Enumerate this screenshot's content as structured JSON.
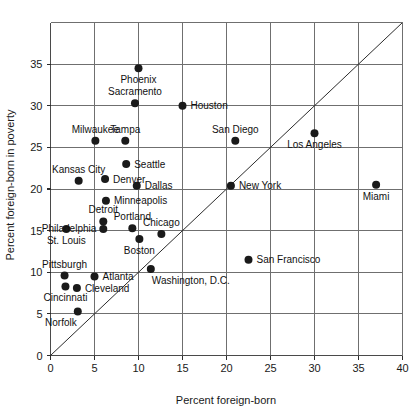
{
  "chart_data": {
    "type": "scatter",
    "title": "",
    "xlabel": "Percent foreign-born",
    "ylabel": "Percent foreign-born in poverty",
    "xlim": [
      0,
      40
    ],
    "ylim": [
      0,
      40
    ],
    "xticks": [
      0,
      5,
      10,
      15,
      20,
      25,
      30,
      35,
      40
    ],
    "yticks": [
      0,
      5,
      10,
      15,
      20,
      25,
      30,
      35
    ],
    "ytick_labels": [
      "0",
      "5",
      "10",
      "15",
      "20",
      "25",
      "30",
      "35"
    ],
    "xtick_labels": [
      "0",
      "5",
      "10",
      "15",
      "20",
      "25",
      "30",
      "35",
      "40"
    ],
    "grid": true,
    "legend": "none",
    "reference_line": {
      "name": "identity-line",
      "from": [
        0,
        0
      ],
      "to": [
        40,
        40
      ],
      "description": "y = x diagonal"
    },
    "points": [
      {
        "label": "Phoenix",
        "x": 10.0,
        "y": 34.5,
        "label_pos": "below"
      },
      {
        "label": "Sacramento",
        "x": 9.6,
        "y": 30.3,
        "label_pos": "above"
      },
      {
        "label": "Houston",
        "x": 15.0,
        "y": 30.0,
        "label_pos": "right"
      },
      {
        "label": "Los Angeles",
        "x": 30.0,
        "y": 26.7,
        "label_pos": "below"
      },
      {
        "label": "Milwaukee",
        "x": 5.1,
        "y": 25.8,
        "label_pos": "above"
      },
      {
        "label": "Tampa",
        "x": 8.5,
        "y": 25.8,
        "label_pos": "above"
      },
      {
        "label": "San Diego",
        "x": 21.0,
        "y": 25.8,
        "label_pos": "above"
      },
      {
        "label": "Seattle",
        "x": 8.6,
        "y": 23.0,
        "label_pos": "right"
      },
      {
        "label": "Denver",
        "x": 6.2,
        "y": 21.2,
        "label_pos": "right"
      },
      {
        "label": "Kansas City",
        "x": 3.2,
        "y": 21.0,
        "label_pos": "above"
      },
      {
        "label": "Miami",
        "x": 37.0,
        "y": 20.5,
        "label_pos": "below"
      },
      {
        "label": "New York",
        "x": 20.5,
        "y": 20.4,
        "label_pos": "right"
      },
      {
        "label": "Dallas",
        "x": 9.8,
        "y": 20.4,
        "label_pos": "right"
      },
      {
        "label": "Minneapolis",
        "x": 6.3,
        "y": 18.6,
        "label_pos": "right"
      },
      {
        "label": "Detroit",
        "x": 6.0,
        "y": 16.1,
        "label_pos": "above"
      },
      {
        "label": "Portland",
        "x": 9.3,
        "y": 15.3,
        "label_pos": "above"
      },
      {
        "label": "St. Louis",
        "x": 1.8,
        "y": 15.2,
        "label_pos": "below"
      },
      {
        "label": "Philadelphia",
        "x": 6.0,
        "y": 15.2,
        "label_pos": "left-below"
      },
      {
        "label": "Chicago",
        "x": 12.6,
        "y": 14.6,
        "label_pos": "above"
      },
      {
        "label": "Boston",
        "x": 10.1,
        "y": 14.0,
        "label_pos": "below"
      },
      {
        "label": "Washington, D.C.",
        "x": 11.4,
        "y": 10.4,
        "label_pos": "below-right"
      },
      {
        "label": "Pittsburgh",
        "x": 1.6,
        "y": 9.6,
        "label_pos": "above"
      },
      {
        "label": "Atlanta",
        "x": 5.0,
        "y": 9.5,
        "label_pos": "right"
      },
      {
        "label": "Cincinnati",
        "x": 1.7,
        "y": 8.3,
        "label_pos": "below"
      },
      {
        "label": "Cleveland",
        "x": 3.0,
        "y": 8.1,
        "label_pos": "right"
      },
      {
        "label": "Norfolk",
        "x": 3.1,
        "y": 5.3,
        "label_pos": "below-left"
      },
      {
        "label": "San Francisco",
        "x": 22.5,
        "y": 11.5,
        "label_pos": "right"
      }
    ]
  },
  "colors": {
    "dot": "#1a1a1a",
    "grid": "#6f6f6f",
    "frame": "#4a4a4a",
    "diagonal": "#2b2b2b",
    "text": "#111111",
    "background": "#ffffff"
  }
}
